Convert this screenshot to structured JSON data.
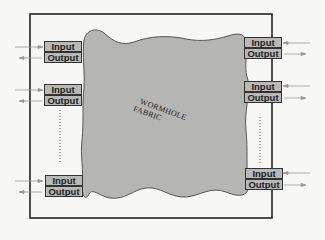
{
  "diagram": {
    "fabric": {
      "label_line1": "WORMHOLE",
      "label_line2": "FABRIC",
      "fill": "#b5b5b3"
    },
    "left_ports": [
      {
        "input": "Input",
        "output": "Output"
      },
      {
        "input": "Input",
        "output": "Output"
      },
      {
        "input": "Input",
        "output": "Output"
      }
    ],
    "right_ports": [
      {
        "input": "Input",
        "output": "Output"
      },
      {
        "input": "Input",
        "output": "Output"
      },
      {
        "input": "Input",
        "output": "Output"
      }
    ],
    "ellipsis": "vertical dotted line indicating additional ports"
  }
}
